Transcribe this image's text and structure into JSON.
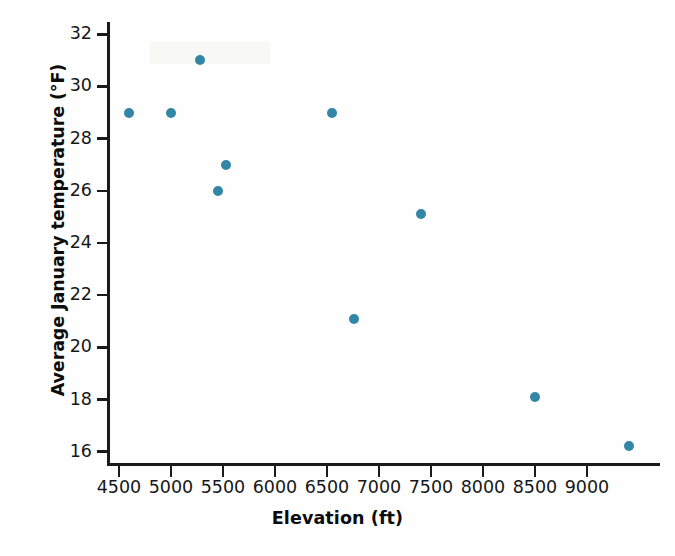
{
  "chart_data": {
    "type": "scatter",
    "title": "",
    "xlabel": "Elevation (ft)",
    "ylabel": "Average January temperature (°F)",
    "xlim": [
      4300,
      9250
    ],
    "ylim": [
      15.3,
      32.6
    ],
    "xticks": [
      4500,
      5000,
      5500,
      6000,
      6500,
      7000,
      7500,
      8000,
      8500,
      9000
    ],
    "xticklabels": [
      "4500",
      "5000",
      "5500",
      "6000",
      "6500",
      "7000",
      "7500",
      "8000",
      "8500",
      "9000"
    ],
    "yticks": [
      16,
      18,
      20,
      22,
      24,
      26,
      28,
      30,
      32
    ],
    "yticklabels": [
      "16",
      "18",
      "20",
      "22",
      "24",
      "26",
      "28",
      "30",
      "32"
    ],
    "grid": false,
    "legend": null,
    "marker_color": "#3387a6",
    "axis_color": "#1b1b1b",
    "x": [
      4600,
      5000,
      5280,
      5450,
      5530,
      6550,
      6760,
      7400,
      8500,
      9400
    ],
    "y": [
      29.0,
      29.0,
      31.0,
      26.0,
      27.0,
      29.0,
      21.1,
      25.1,
      18.1,
      16.2
    ],
    "points": [
      {
        "x": 4600,
        "y": 29.0
      },
      {
        "x": 5000,
        "y": 29.0
      },
      {
        "x": 5280,
        "y": 31.0
      },
      {
        "x": 5450,
        "y": 26.0
      },
      {
        "x": 5530,
        "y": 27.0
      },
      {
        "x": 6550,
        "y": 29.0
      },
      {
        "x": 6760,
        "y": 21.1
      },
      {
        "x": 7400,
        "y": 25.1
      },
      {
        "x": 8500,
        "y": 18.1
      },
      {
        "x": 9400,
        "y": 16.2
      }
    ]
  }
}
